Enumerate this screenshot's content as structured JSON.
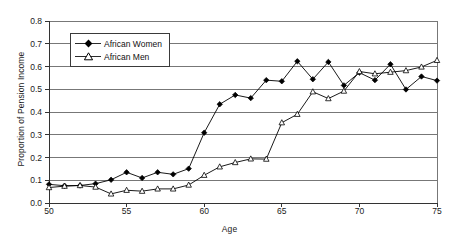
{
  "chart_data": {
    "type": "line",
    "title": "",
    "xlabel": "Age",
    "ylabel": "Proportion of Pension Income",
    "xlim": [
      50,
      75
    ],
    "ylim": [
      0.0,
      0.8
    ],
    "xticks": [
      50,
      55,
      60,
      65,
      70,
      75
    ],
    "xtick_labels": [
      "50",
      "55",
      "60",
      "65",
      "70",
      "75"
    ],
    "yticks": [
      0.0,
      0.1,
      0.2,
      0.3,
      0.4,
      0.5,
      0.6,
      0.7,
      0.8
    ],
    "ytick_labels": [
      "0.0",
      "0.1",
      "0.2",
      "0.3",
      "0.4",
      "0.5",
      "0.6",
      "0.7",
      "0.8"
    ],
    "grid": "horizontal",
    "legend_position": "upper-left-inside",
    "x": [
      50,
      51,
      52,
      53,
      54,
      55,
      56,
      57,
      58,
      59,
      60,
      61,
      62,
      63,
      64,
      65,
      66,
      67,
      68,
      69,
      70,
      71,
      72,
      73,
      74,
      75
    ],
    "series": [
      {
        "name": "African Women",
        "marker": "filled-diamond",
        "color": "#000000",
        "values": [
          0.082,
          0.076,
          0.077,
          0.085,
          0.102,
          0.135,
          0.11,
          0.135,
          0.126,
          0.151,
          0.309,
          0.434,
          0.475,
          0.461,
          0.54,
          0.535,
          0.623,
          0.544,
          0.62,
          0.517,
          0.573,
          0.54,
          0.61,
          0.499,
          0.556,
          0.538
        ]
      },
      {
        "name": "African Men",
        "marker": "open-triangle",
        "color": "#000000",
        "values": [
          0.068,
          0.074,
          0.077,
          0.07,
          0.04,
          0.056,
          0.052,
          0.062,
          0.062,
          0.079,
          0.122,
          0.159,
          0.178,
          0.194,
          0.193,
          0.353,
          0.39,
          0.489,
          0.459,
          0.492,
          0.578,
          0.568,
          0.575,
          0.582,
          0.598,
          0.627
        ]
      }
    ]
  },
  "legend": {
    "items": [
      {
        "label": "African Women"
      },
      {
        "label": "African Men"
      }
    ]
  }
}
